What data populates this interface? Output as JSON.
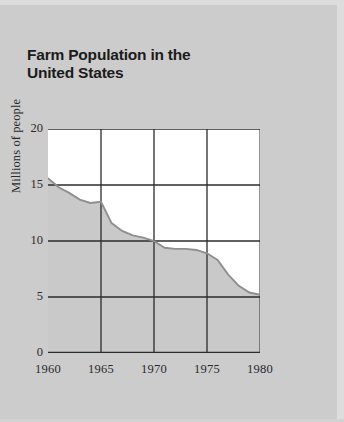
{
  "chart_data": {
    "type": "area",
    "title": "Farm Population in the United States",
    "title_line1": "Farm Population in the",
    "title_line2": "United States",
    "xlabel": "",
    "ylabel": "Millions of people",
    "xlim": [
      1960,
      1980
    ],
    "ylim": [
      0,
      20
    ],
    "grid": true,
    "legend": "none",
    "yticks": [
      20,
      15,
      10,
      5,
      0
    ],
    "xticks": [
      1960,
      1965,
      1970,
      1975,
      1980
    ],
    "series": [
      {
        "name": "Farm population",
        "x": [
          1960,
          1961,
          1962,
          1963,
          1964,
          1965,
          1966,
          1967,
          1968,
          1969,
          1970,
          1971,
          1972,
          1973,
          1974,
          1975,
          1976,
          1977,
          1978,
          1979,
          1980
        ],
        "values": [
          15.6,
          14.8,
          14.3,
          13.7,
          13.4,
          13.5,
          11.6,
          10.9,
          10.5,
          10.3,
          10.0,
          9.4,
          9.3,
          9.3,
          9.2,
          8.9,
          8.3,
          7.0,
          6.0,
          5.4,
          5.2
        ]
      }
    ],
    "annotations": []
  },
  "colors": {
    "page_background": "#cccccc",
    "plot_background": "#ffffff",
    "area_fill": "#c9c9c9",
    "curve_line": "#8f8f8f",
    "axis": "#1a1a1a",
    "grid": "#2b2b2b",
    "text": "#2a2a2a",
    "title_text": "#1b1b1b"
  }
}
